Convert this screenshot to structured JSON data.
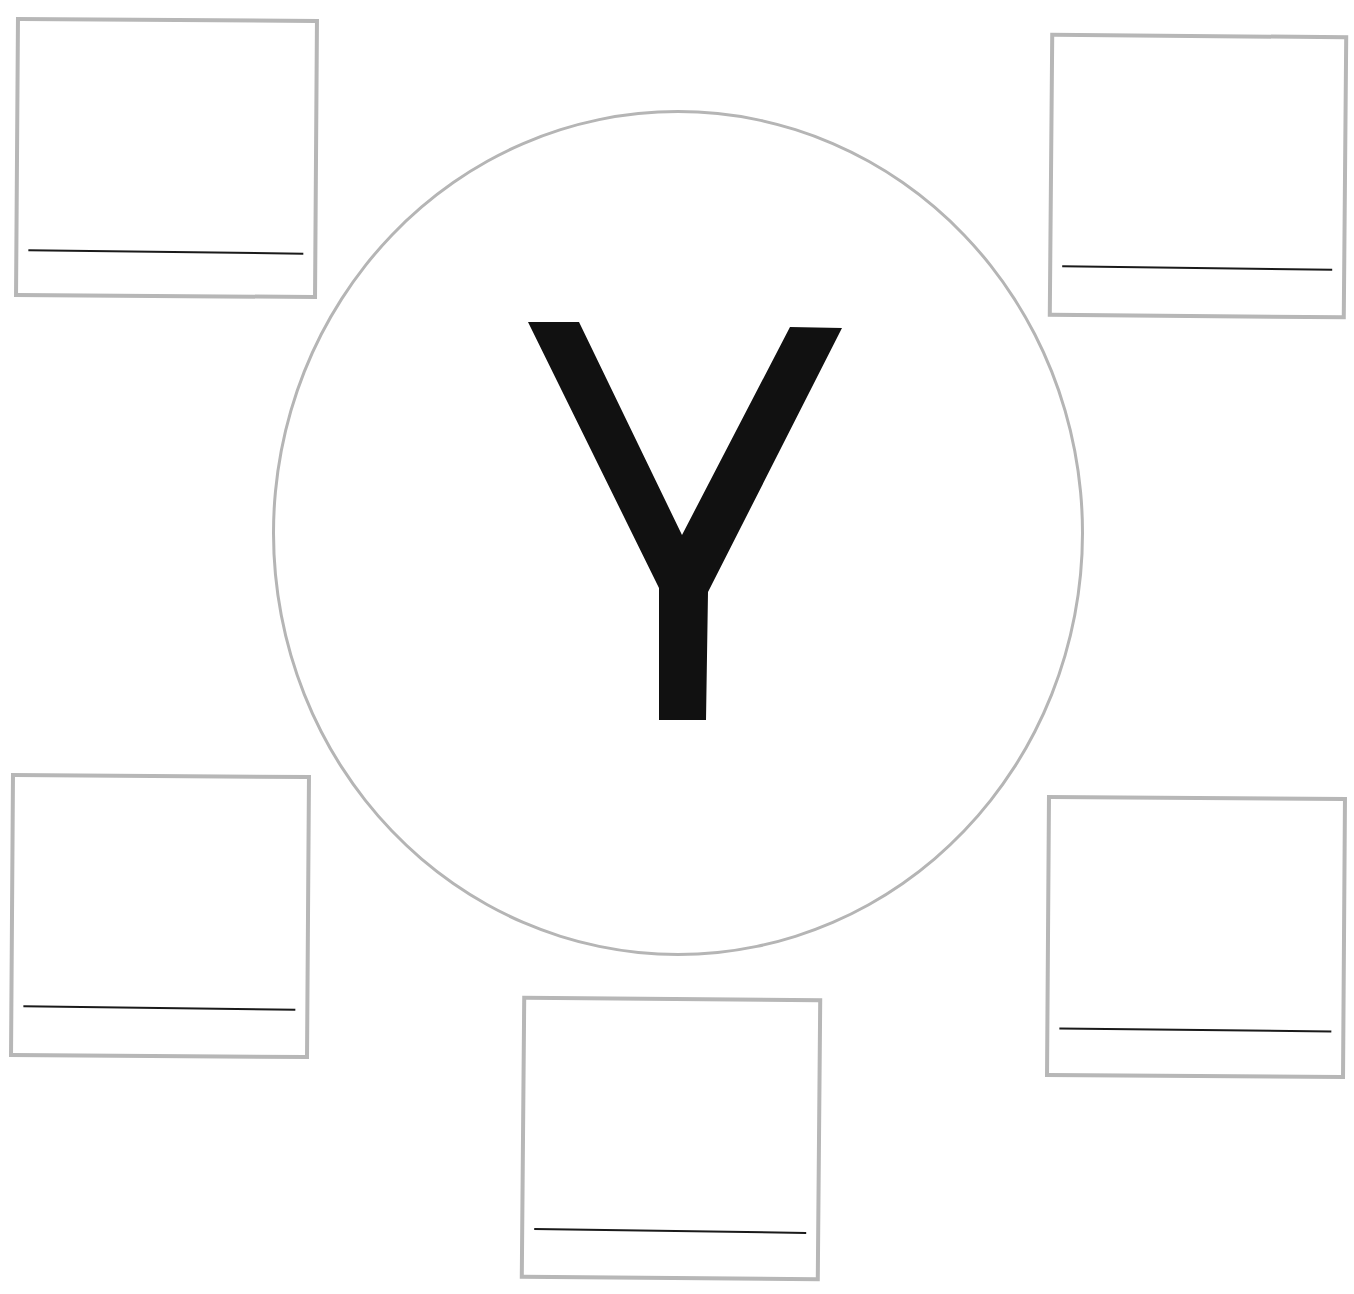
{
  "worksheet": {
    "letter": "Y",
    "colors": {
      "border": "#b7b7b7",
      "letter": "#111111",
      "write_line": "#1a1a1a",
      "background": "#ffffff"
    },
    "boxes": [
      {
        "position": "top-left",
        "answer": ""
      },
      {
        "position": "top-right",
        "answer": ""
      },
      {
        "position": "bottom-left",
        "answer": ""
      },
      {
        "position": "bottom-center",
        "answer": ""
      },
      {
        "position": "bottom-right",
        "answer": ""
      }
    ]
  }
}
